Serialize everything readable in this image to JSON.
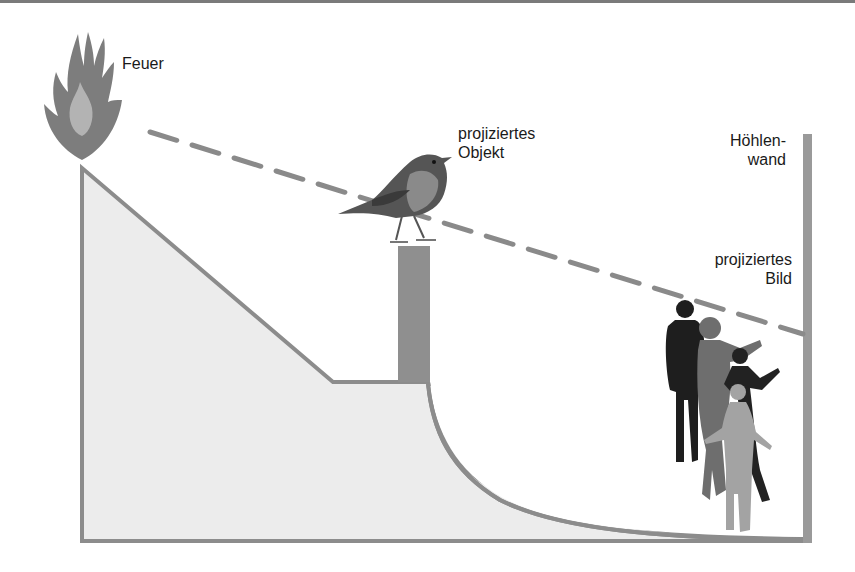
{
  "labels": {
    "fire": "Feuer",
    "projected_object_line1": "projiziertes",
    "projected_object_line2": "Objekt",
    "cave_wall_line1": "Höhlen-",
    "cave_wall_line2": "wand",
    "projected_image_line1": "projiziertes",
    "projected_image_line2": "Bild"
  },
  "colors": {
    "outline": "#8c8c8c",
    "ground_fill": "#ececec",
    "wall": "#9a9a9a",
    "post": "#8f8f8f",
    "flame_outer": "#7d7d7d",
    "flame_inner": "#b3b3b3",
    "dashed_ray": "#8a8a8a",
    "text": "#1a1a1a"
  },
  "elements": [
    "fire",
    "bird-on-post",
    "cave-wall",
    "people-silhouettes",
    "light-ray"
  ]
}
